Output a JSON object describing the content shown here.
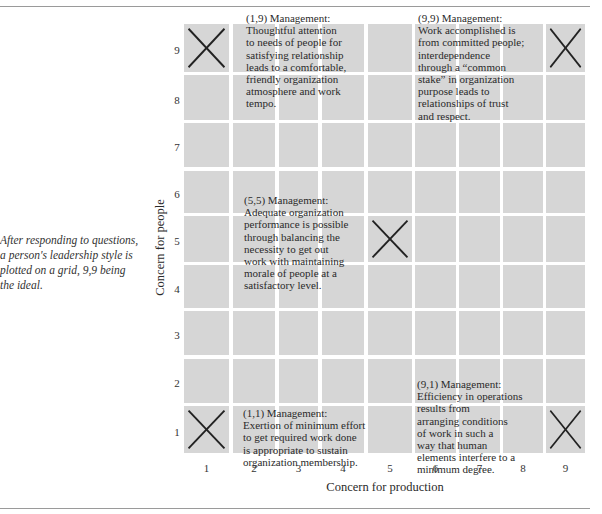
{
  "caption": "After responding to questions, a person's leadership style is plotted on a grid, 9,9 being the ideal.",
  "chart_data": {
    "type": "grid",
    "xlabel": "Concern for production",
    "ylabel": "Concern for people",
    "x_ticks": [
      "1",
      "2",
      "3",
      "4",
      "5",
      "6",
      "7",
      "8",
      "9"
    ],
    "y_ticks": [
      "9",
      "8",
      "7",
      "6",
      "5",
      "4",
      "3",
      "2",
      "1"
    ],
    "xlim": [
      1,
      9
    ],
    "ylim": [
      1,
      9
    ],
    "marked_points": [
      {
        "x": 1,
        "y": 9,
        "label": "(1,9) Management"
      },
      {
        "x": 9,
        "y": 9,
        "label": "(9,9) Management"
      },
      {
        "x": 5,
        "y": 5,
        "label": "(5,5) Management"
      },
      {
        "x": 1,
        "y": 1,
        "label": "(1,1) Management"
      },
      {
        "x": 9,
        "y": 1,
        "label": "(9,1) Management"
      }
    ]
  },
  "descriptions": {
    "m19": {
      "lines": [
        "(1,9) Management:",
        "Thoughtful attention",
        "to needs of people for",
        "satisfying relationship",
        "leads to a comfortable,",
        "friendly organization",
        "atmosphere and work",
        "tempo."
      ]
    },
    "m99": {
      "lines": [
        "(9,9) Management:",
        "Work accomplished is",
        "from committed people;",
        "interdependence",
        "through a “common",
        "stake” in organization",
        "purpose leads to",
        "relationships of trust",
        "and respect."
      ]
    },
    "m55": {
      "lines": [
        "(5,5) Management:",
        "Adequate organization",
        "performance is possible",
        "through balancing the",
        "necessity to get out",
        "work with maintaining",
        "morale of people at a",
        "satisfactory level."
      ]
    },
    "m11": {
      "lines": [
        "(1,1) Management:",
        "Exertion of minimum effort",
        "to get required work done",
        "is appropriate to sustain",
        "organization membership."
      ]
    },
    "m91": {
      "lines": [
        "(9,1) Management:",
        "Efficiency in operations",
        "results from",
        "arranging conditions",
        "of work in such a",
        "way that human",
        "elements interfere to a",
        "minimum degree."
      ]
    }
  },
  "colors": {
    "cell": "#d6d6d6",
    "mark": "#222222",
    "rule": "#9a9a9a"
  }
}
